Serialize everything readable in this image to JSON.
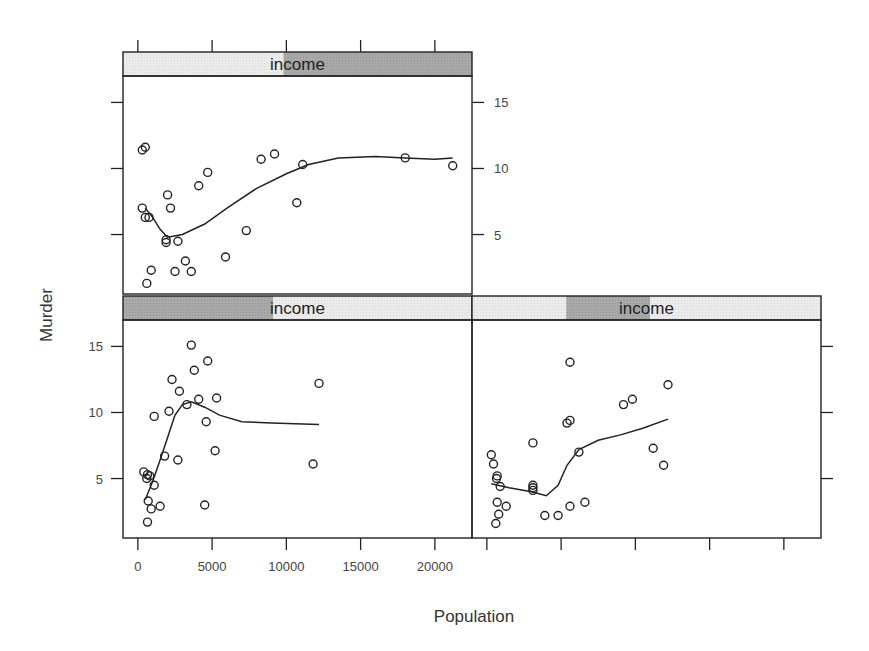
{
  "chart_data": {
    "type": "scatter",
    "layout": "lattice coplot, 3 panels (2 columns x 2 rows, top-right empty)",
    "xlabel": "Population",
    "ylabel": "Murder",
    "x_ticks": [
      0,
      5000,
      10000,
      15000,
      20000
    ],
    "y_ticks": [
      5,
      10,
      15
    ],
    "xlim": [
      -1000,
      22500
    ],
    "ylim": [
      0.5,
      17
    ],
    "grid": false,
    "smoother": "loess",
    "panels": [
      {
        "id": "bottom-left",
        "strip_label": "income",
        "strip_shade": [
          0.0,
          0.43
        ],
        "points": [
          [
            400,
            5.5
          ],
          [
            650,
            5.3
          ],
          [
            600,
            5.0
          ],
          [
            800,
            5.2
          ],
          [
            1100,
            4.5
          ],
          [
            700,
            3.3
          ],
          [
            900,
            2.7
          ],
          [
            1500,
            2.9
          ],
          [
            650,
            1.7
          ],
          [
            1100,
            9.7
          ],
          [
            1800,
            6.7
          ],
          [
            2100,
            10.1
          ],
          [
            2300,
            12.5
          ],
          [
            2800,
            11.6
          ],
          [
            2700,
            6.4
          ],
          [
            3300,
            10.6
          ],
          [
            3600,
            15.1
          ],
          [
            3800,
            13.2
          ],
          [
            4100,
            11.0
          ],
          [
            4700,
            13.9
          ],
          [
            4600,
            9.3
          ],
          [
            4500,
            3.0
          ],
          [
            5300,
            11.1
          ],
          [
            5200,
            7.1
          ],
          [
            11800,
            6.1
          ],
          [
            12200,
            12.2
          ]
        ],
        "smooth": [
          [
            500,
            3.4
          ],
          [
            1000,
            4.8
          ],
          [
            1500,
            6.4
          ],
          [
            2000,
            8.1
          ],
          [
            2500,
            9.8
          ],
          [
            3000,
            10.6
          ],
          [
            3600,
            10.8
          ],
          [
            4500,
            10.4
          ],
          [
            5500,
            9.8
          ],
          [
            7000,
            9.3
          ],
          [
            9000,
            9.2
          ],
          [
            12200,
            9.1
          ]
        ]
      },
      {
        "id": "bottom-right",
        "strip_label": "income",
        "strip_shade": [
          0.27,
          0.51
        ],
        "points": [
          [
            300,
            6.8
          ],
          [
            450,
            6.1
          ],
          [
            700,
            5.2
          ],
          [
            650,
            5.0
          ],
          [
            900,
            4.4
          ],
          [
            700,
            3.2
          ],
          [
            800,
            2.3
          ],
          [
            1300,
            2.9
          ],
          [
            600,
            1.6
          ],
          [
            3100,
            7.7
          ],
          [
            3100,
            4.5
          ],
          [
            3100,
            4.3
          ],
          [
            3100,
            4.1
          ],
          [
            3900,
            2.2
          ],
          [
            4800,
            2.2
          ],
          [
            5600,
            2.9
          ],
          [
            6600,
            3.2
          ],
          [
            5400,
            9.2
          ],
          [
            5600,
            9.4
          ],
          [
            6200,
            7.0
          ],
          [
            5600,
            13.8
          ],
          [
            9200,
            10.6
          ],
          [
            9800,
            11.0
          ],
          [
            11200,
            7.3
          ],
          [
            11900,
            6.0
          ],
          [
            12200,
            12.1
          ]
        ],
        "smooth": [
          [
            300,
            4.6
          ],
          [
            1500,
            4.3
          ],
          [
            3000,
            4.0
          ],
          [
            4000,
            3.7
          ],
          [
            4800,
            4.5
          ],
          [
            5400,
            6.0
          ],
          [
            6200,
            7.2
          ],
          [
            7500,
            7.9
          ],
          [
            9000,
            8.3
          ],
          [
            10500,
            8.8
          ],
          [
            12200,
            9.5
          ]
        ]
      },
      {
        "id": "top-left",
        "strip_label": "income",
        "strip_shade": [
          0.46,
          1.0
        ],
        "points": [
          [
            300,
            11.4
          ],
          [
            500,
            11.6
          ],
          [
            300,
            7.0
          ],
          [
            500,
            6.3
          ],
          [
            750,
            6.3
          ],
          [
            900,
            2.3
          ],
          [
            600,
            1.3
          ],
          [
            2000,
            8.0
          ],
          [
            2200,
            7.0
          ],
          [
            1900,
            4.6
          ],
          [
            1900,
            4.4
          ],
          [
            2700,
            4.5
          ],
          [
            2500,
            2.2
          ],
          [
            3200,
            3.0
          ],
          [
            3600,
            2.2
          ],
          [
            4100,
            8.7
          ],
          [
            4700,
            9.7
          ],
          [
            5900,
            3.3
          ],
          [
            7300,
            5.3
          ],
          [
            8300,
            10.7
          ],
          [
            9200,
            11.1
          ],
          [
            11100,
            10.3
          ],
          [
            10700,
            7.4
          ],
          [
            18000,
            10.8
          ],
          [
            21200,
            10.2
          ]
        ],
        "smooth": [
          [
            500,
            7.0
          ],
          [
            1000,
            6.3
          ],
          [
            1500,
            5.4
          ],
          [
            2000,
            4.8
          ],
          [
            3000,
            5.0
          ],
          [
            4500,
            5.8
          ],
          [
            6000,
            7.0
          ],
          [
            8000,
            8.5
          ],
          [
            10000,
            9.6
          ],
          [
            11500,
            10.3
          ],
          [
            13500,
            10.8
          ],
          [
            16000,
            10.9
          ],
          [
            18000,
            10.8
          ],
          [
            20000,
            10.7
          ],
          [
            21200,
            10.8
          ]
        ]
      }
    ]
  }
}
